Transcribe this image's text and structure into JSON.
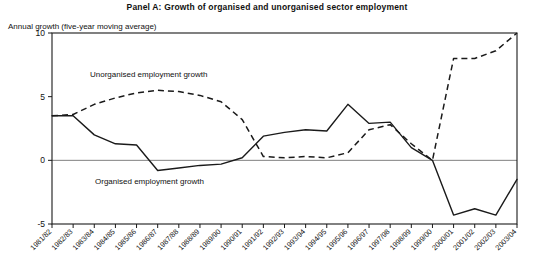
{
  "panel": {
    "title": "Panel A: Growth of organised and unorganised sector employment",
    "axis_caption": "Annual growth (five-year moving average)"
  },
  "annotations": {
    "unorganised": "Unorganised employment growth",
    "organised": "Organised employment growth"
  },
  "style": {
    "line_color": "#1a1a1a",
    "frame_color": "#1a1a1a",
    "zero_line_color": "#808080",
    "background": "#ffffff"
  },
  "chart_data": {
    "type": "line",
    "title": "Panel A: Growth of organised and unorganised sector employment",
    "xlabel": "",
    "ylabel": "Annual growth (five-year moving average)",
    "ylim": [
      -5,
      10
    ],
    "yticks": [
      -5,
      0,
      5,
      10
    ],
    "ytick_labels": [
      "-5",
      "0",
      "5",
      "10"
    ],
    "grid": false,
    "zero_line": true,
    "legend_position": "inline-annotations",
    "categories": [
      "1981/82",
      "1982/83",
      "1983/84",
      "1984/85",
      "1985/86",
      "1986/87",
      "1987/88",
      "1988/89",
      "1989/90",
      "1990/91",
      "1991/92",
      "1992/93",
      "1993/94",
      "1994/95",
      "1995/96",
      "1996/97",
      "1997/98",
      "1998/99",
      "1999/00",
      "2000/01",
      "2001/02",
      "2002/03",
      "2003/04"
    ],
    "series": [
      {
        "name": "Organised employment growth",
        "style": "solid",
        "values": [
          3.5,
          3.5,
          2.0,
          1.3,
          1.2,
          -0.8,
          -0.6,
          -0.4,
          -0.3,
          0.2,
          1.9,
          2.2,
          2.4,
          2.3,
          4.4,
          2.9,
          3.0,
          1.0,
          0.0,
          -4.3,
          -3.8,
          -4.3,
          -1.5
        ]
      },
      {
        "name": "Unorganised employment growth",
        "style": "dashed",
        "values": [
          3.5,
          3.6,
          4.4,
          4.9,
          5.3,
          5.5,
          5.4,
          5.1,
          4.6,
          3.2,
          0.3,
          0.2,
          0.3,
          0.2,
          0.6,
          2.4,
          2.8,
          1.3,
          0.0,
          8.0,
          8.0,
          8.6,
          10.0
        ]
      }
    ]
  }
}
